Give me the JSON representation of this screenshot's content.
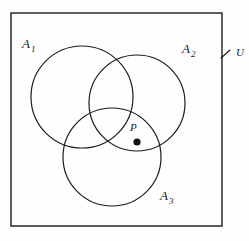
{
  "diagram": {
    "type": "venn-diagram",
    "width": 249,
    "height": 241,
    "background_color": "#fefefe",
    "stroke_color": "#1a1a1a",
    "universe": {
      "label": "U",
      "label_x": 236,
      "label_y": 56,
      "rect": {
        "x": 11,
        "y": 13,
        "width": 211,
        "height": 213
      },
      "leader_line": {
        "x1": 221,
        "y1": 58,
        "x2": 230,
        "y2": 50
      },
      "stroke_width": 1.4
    },
    "sets": [
      {
        "name": "A1",
        "label_main": "A",
        "label_sub": "1",
        "cx": 82,
        "cy": 97,
        "r": 51,
        "label_x": 22,
        "label_y": 48,
        "sub_dx": 9,
        "sub_dy": 4,
        "stroke_width": 1.2
      },
      {
        "name": "A2",
        "label_main": "A",
        "label_sub": "2",
        "cx": 137,
        "cy": 103,
        "r": 48,
        "label_x": 182,
        "label_y": 53,
        "sub_dx": 9,
        "sub_dy": 4,
        "stroke_width": 1.2
      },
      {
        "name": "A3",
        "label_main": "A",
        "label_sub": "3",
        "cx": 112,
        "cy": 157,
        "r": 49,
        "label_x": 160,
        "label_y": 200,
        "sub_dx": 9,
        "sub_dy": 4,
        "stroke_width": 1.2
      }
    ],
    "points": [
      {
        "name": "P",
        "label": "P",
        "label_x": 130,
        "label_y": 131,
        "dot_cx": 137,
        "dot_cy": 142,
        "dot_r": 3.6,
        "dot_color": "#111111"
      }
    ]
  }
}
